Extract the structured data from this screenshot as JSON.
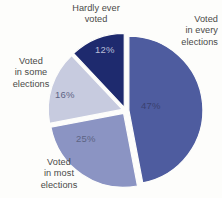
{
  "chart_data": {
    "type": "pie",
    "title": "",
    "categories": [
      "Voted in every elections",
      "Voted in most elections",
      "Voted in some elections",
      "Hardly ever voted"
    ],
    "values": [
      47,
      25,
      16,
      12
    ],
    "value_labels": [
      "47%",
      "25%",
      "16%",
      "12%"
    ],
    "colors": [
      "#4e5c9f",
      "#8b94c3",
      "#c7cbdf",
      "#1e2a6e"
    ],
    "exploded": true,
    "legend_position": "outside-callout",
    "grid": false
  },
  "labels": {
    "every": "Voted\nin every\nelections",
    "most": "Voted\nin most\nelections",
    "some": "Voted\nin some\nelections",
    "hardly": "Hardly ever\nvoted"
  },
  "slices": {
    "every": {
      "pct": "47%"
    },
    "most": {
      "pct": "25%"
    },
    "some": {
      "pct": "16%"
    },
    "hardly": {
      "pct": "12%"
    }
  }
}
